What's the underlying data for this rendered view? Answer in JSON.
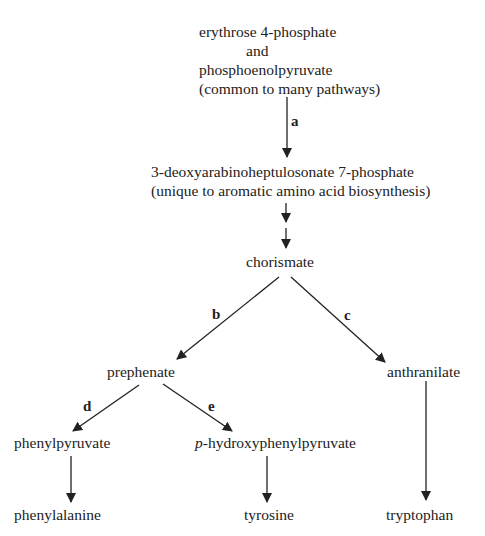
{
  "diagram": {
    "nodes": {
      "start": {
        "lines": [
          "erythrose 4-phosphate",
          "and",
          "phosphoenolpyruvate",
          "(common to many pathways)"
        ]
      },
      "dahp": {
        "lines": [
          "3-deoxyarabinoheptulosonate 7-phosphate",
          "(unique to aromatic amino acid biosynthesis)"
        ]
      },
      "chorismate": {
        "label": "chorismate"
      },
      "prephenate": {
        "label": "prephenate"
      },
      "anthranilate": {
        "label": "anthranilate"
      },
      "phenylpyruvate": {
        "label": "phenylpyruvate"
      },
      "hydroxyphenylpyruvate": {
        "prefix": "p",
        "label": "-hydroxyphenylpyruvate"
      },
      "phenylalanine": {
        "label": "phenylalanine"
      },
      "tyrosine": {
        "label": "tyrosine"
      },
      "tryptophan": {
        "label": "tryptophan"
      }
    },
    "step_labels": {
      "a": "a",
      "b": "b",
      "c": "c",
      "d": "d",
      "e": "e"
    },
    "edges": [
      {
        "from": "start",
        "to": "dahp",
        "label": "a"
      },
      {
        "from": "dahp",
        "to": "intermediate",
        "label": ""
      },
      {
        "from": "intermediate",
        "to": "chorismate",
        "label": ""
      },
      {
        "from": "chorismate",
        "to": "prephenate",
        "label": "b"
      },
      {
        "from": "chorismate",
        "to": "anthranilate",
        "label": "c"
      },
      {
        "from": "prephenate",
        "to": "phenylpyruvate",
        "label": "d"
      },
      {
        "from": "prephenate",
        "to": "hydroxyphenylpyruvate",
        "label": "e"
      },
      {
        "from": "phenylpyruvate",
        "to": "phenylalanine",
        "label": ""
      },
      {
        "from": "hydroxyphenylpyruvate",
        "to": "tyrosine",
        "label": ""
      },
      {
        "from": "anthranilate",
        "to": "tryptophan",
        "label": ""
      }
    ],
    "colors": {
      "ink": "#222222",
      "background": "#ffffff"
    }
  }
}
